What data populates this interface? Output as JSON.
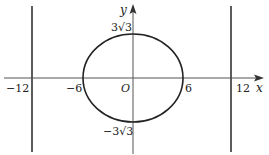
{
  "figure": {
    "type": "ellipse-with-directrices",
    "axes": {
      "x_label": "x",
      "y_label": "y",
      "origin_label": "O"
    },
    "ticks": {
      "x_neg_far": "−12",
      "x_neg": "−6",
      "x_pos": "6",
      "x_pos_far": "12",
      "y_pos": "3√3",
      "y_neg": "−3√3"
    },
    "ellipse": {
      "a": 6,
      "b": "3√3",
      "center": [
        0,
        0
      ]
    },
    "vertical_lines": [
      {
        "x": -12
      },
      {
        "x": 12
      }
    ],
    "colors": {
      "stroke": "#222222",
      "axis": "#555555",
      "background": "#ffffff"
    }
  }
}
